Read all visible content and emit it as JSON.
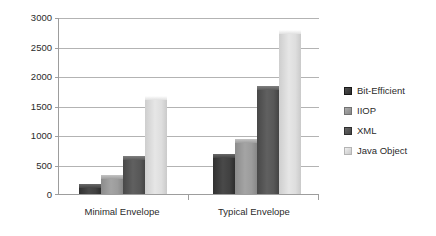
{
  "chart_data": {
    "type": "bar",
    "title": "",
    "subtitle": "",
    "xlabel": "",
    "ylabel": "",
    "categories": [
      "Minimal Envelope",
      "Typical Envelope"
    ],
    "series": [
      {
        "name": "Bit-Efficient",
        "values": [
          170,
          680
        ],
        "color": "#3f3f3f"
      },
      {
        "name": "IIOP",
        "values": [
          320,
          930
        ],
        "color": "#9a9a9a"
      },
      {
        "name": "XML",
        "values": [
          640,
          1830
        ],
        "color": "#565656"
      },
      {
        "name": "Java Object",
        "values": [
          1660,
          2780
        ],
        "color": "#dcdcdc"
      }
    ],
    "ylim": [
      0,
      3000
    ],
    "yticks": [
      0,
      500,
      1000,
      1500,
      2000,
      2500,
      3000
    ],
    "ytick_labels": [
      "0",
      "500",
      "1000",
      "1500",
      "2000",
      "2500",
      "3000"
    ],
    "grid": true,
    "grid_axis": "y",
    "legend_position": "right",
    "legend_entries": [
      "Bit-Efficient",
      "IIOP",
      "XML",
      "Java Object"
    ],
    "annotations": []
  },
  "axis": {
    "y_tick_0": "0",
    "y_tick_1": "500",
    "y_tick_2": "1000",
    "y_tick_3": "1500",
    "y_tick_4": "2000",
    "y_tick_5": "2500",
    "y_tick_6": "3000",
    "x_cat_0": "Minimal Envelope",
    "x_cat_1": "Typical Envelope"
  },
  "legend": {
    "item_0": "Bit-Efficient",
    "item_1": "IIOP",
    "item_2": "XML",
    "item_3": "Java Object"
  },
  "colors": {
    "bit_efficient": "#3f3f3f",
    "iiop": "#9a9a9a",
    "xml": "#565656",
    "java_object": "#dcdcdc",
    "gridline": "#b3b3b3",
    "axis": "#9d9d9d",
    "text": "#2b2b2b",
    "background": "#ffffff"
  }
}
